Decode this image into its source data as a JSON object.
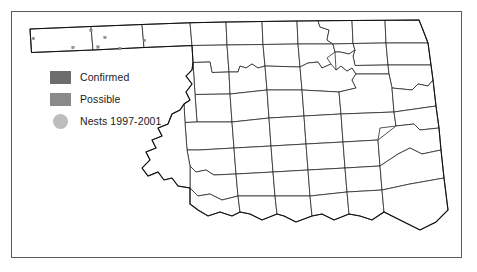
{
  "map": {
    "title": "Oklahoma county distribution map",
    "region": "Oklahoma",
    "border_color": "#5a5a5a",
    "background_color": "#ffffff",
    "county_line_color": "#2a2a2a",
    "state_outline_color": "#111111"
  },
  "legend": {
    "items": [
      {
        "key": "confirmed",
        "label": "Confirmed",
        "symbol": "filled-square",
        "color": "#6d6d6d"
      },
      {
        "key": "possible",
        "label": "Possible",
        "symbol": "filled-square",
        "color": "#8a8a8a"
      },
      {
        "key": "nests",
        "label": "Nests 1997-2001",
        "symbol": "filled-circle",
        "color": "#bdbdbd"
      }
    ]
  },
  "nest_markers": {
    "color": "#8d8d8d",
    "shape": "small-square",
    "count": 7,
    "points": [
      {
        "x": 33.5,
        "y": 38.5
      },
      {
        "x": 91.0,
        "y": 30.5
      },
      {
        "x": 105.0,
        "y": 37.5
      },
      {
        "x": 73.0,
        "y": 47.5
      },
      {
        "x": 98.0,
        "y": 47.0
      },
      {
        "x": 120.0,
        "y": 48.5
      },
      {
        "x": 144.5,
        "y": 40.5
      }
    ]
  }
}
